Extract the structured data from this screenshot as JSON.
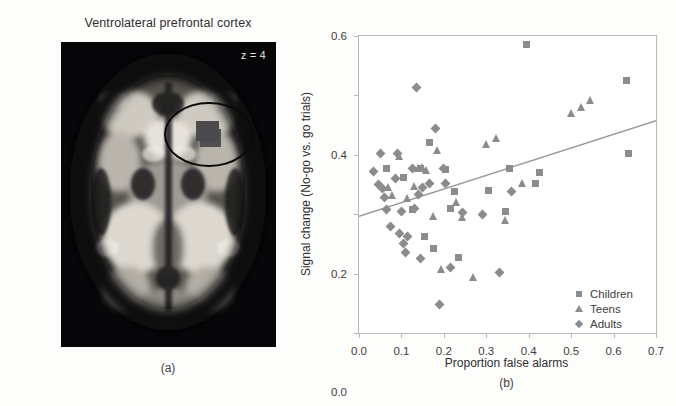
{
  "figure": {
    "panel_a": {
      "label": "(a)",
      "title": "Ventrolateral prefrontal cortex",
      "slice_label": "z = 4",
      "annotation": "roi-ellipse"
    },
    "panel_b": {
      "label": "(b)"
    }
  },
  "colors": {
    "marker": "#8c8c8e",
    "regression_line": "#9a9a9c",
    "axis": "#b9b9b9",
    "text": "#3d3d3d",
    "brain_background": "#07070a",
    "roi_outline": "#0a0a0a"
  },
  "chart_data": {
    "type": "scatter",
    "title": "",
    "xlabel": "Proportion false alarms",
    "ylabel": "Signal change (No-go vs. go trials)",
    "xlim": [
      0.0,
      0.7
    ],
    "ylim": [
      -0.4,
      0.6
    ],
    "xticks": [
      "0.0",
      "0.1",
      "0.2",
      "0.3",
      "0.4",
      "0.5",
      "0.6",
      "0.7"
    ],
    "xtick_values": [
      0.0,
      0.1,
      0.2,
      0.3,
      0.4,
      0.5,
      0.6,
      0.7
    ],
    "yticks": [
      "0.6",
      "0.4",
      "0.2",
      "0.0",
      "-0.2",
      "-0.4"
    ],
    "ytick_values": [
      0.6,
      0.4,
      0.2,
      0.0,
      -0.2,
      -0.4
    ],
    "grid": false,
    "legend_position": "bottom-right",
    "legend": [
      {
        "name": "Children",
        "marker": "square"
      },
      {
        "name": "Teens",
        "marker": "triangle"
      },
      {
        "name": "Adults",
        "marker": "diamond"
      }
    ],
    "regression_line": {
      "x": [
        0.0,
        0.7
      ],
      "y": [
        -0.007,
        0.315
      ]
    },
    "series": [
      {
        "name": "Children",
        "marker": "square",
        "points": [
          [
            0.065,
            0.155
          ],
          [
            0.105,
            0.125
          ],
          [
            0.125,
            0.015
          ],
          [
            0.145,
            0.155
          ],
          [
            0.155,
            -0.075
          ],
          [
            0.165,
            0.24
          ],
          [
            0.175,
            -0.115
          ],
          [
            0.205,
            0.15
          ],
          [
            0.215,
            0.02
          ],
          [
            0.225,
            0.075
          ],
          [
            0.235,
            -0.145
          ],
          [
            0.305,
            0.08
          ],
          [
            0.345,
            0.01
          ],
          [
            0.355,
            0.155
          ],
          [
            0.395,
            0.57
          ],
          [
            0.415,
            0.105
          ],
          [
            0.425,
            0.14
          ],
          [
            0.63,
            0.45
          ],
          [
            0.635,
            0.205
          ]
        ]
      },
      {
        "name": "Teens",
        "marker": "triangle",
        "points": [
          [
            0.07,
            0.09
          ],
          [
            0.08,
            0.065
          ],
          [
            0.095,
            0.195
          ],
          [
            0.115,
            0.055
          ],
          [
            0.13,
            0.095
          ],
          [
            0.14,
            0.155
          ],
          [
            0.15,
            0.16
          ],
          [
            0.16,
            0.15
          ],
          [
            0.175,
            -0.005
          ],
          [
            0.185,
            0.215
          ],
          [
            0.195,
            -0.185
          ],
          [
            0.23,
            0.04
          ],
          [
            0.245,
            -0.01
          ],
          [
            0.27,
            -0.21
          ],
          [
            0.3,
            0.235
          ],
          [
            0.325,
            0.255
          ],
          [
            0.345,
            -0.02
          ],
          [
            0.385,
            0.105
          ],
          [
            0.5,
            0.34
          ],
          [
            0.525,
            0.36
          ],
          [
            0.545,
            0.385
          ]
        ]
      },
      {
        "name": "Adults",
        "marker": "diamond",
        "points": [
          [
            0.035,
            0.145
          ],
          [
            0.045,
            0.1
          ],
          [
            0.05,
            0.205
          ],
          [
            0.055,
            0.085
          ],
          [
            0.06,
            0.055
          ],
          [
            0.065,
            0.015
          ],
          [
            0.075,
            -0.04
          ],
          [
            0.085,
            0.12
          ],
          [
            0.09,
            0.205
          ],
          [
            0.095,
            -0.065
          ],
          [
            0.1,
            0.01
          ],
          [
            0.105,
            -0.1
          ],
          [
            0.11,
            -0.13
          ],
          [
            0.115,
            -0.075
          ],
          [
            0.125,
            0.155
          ],
          [
            0.135,
            0.425
          ],
          [
            0.14,
            0.065
          ],
          [
            0.145,
            -0.15
          ],
          [
            0.15,
            0.09
          ],
          [
            0.165,
            0.105
          ],
          [
            0.18,
            0.29
          ],
          [
            0.19,
            -0.305
          ],
          [
            0.2,
            0.155
          ],
          [
            0.205,
            0.105
          ],
          [
            0.215,
            -0.18
          ],
          [
            0.245,
            0.005
          ],
          [
            0.29,
            0.0
          ],
          [
            0.33,
            -0.195
          ],
          [
            0.36,
            0.075
          ],
          [
            0.13,
            0.02
          ]
        ]
      }
    ]
  }
}
